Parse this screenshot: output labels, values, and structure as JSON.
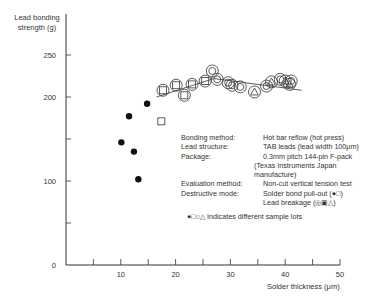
{
  "chart_data": {
    "type": "scatter",
    "title": "",
    "xlabel": "Solder thickness (μm)",
    "ylabel": "Lead bonding strength (g)",
    "xlim": [
      0,
      50
    ],
    "ylim": [
      0,
      300
    ],
    "x_ticks": [
      10,
      20,
      30,
      40,
      50
    ],
    "y_ticks": [
      0,
      100,
      200,
      250
    ],
    "grid": false,
    "series": [
      {
        "name": "Solder bond pull-out (filled circle)",
        "marker": "filled-circle",
        "points": [
          [
            14.8,
            192
          ],
          [
            11.5,
            177
          ],
          [
            10.1,
            146
          ],
          [
            12.4,
            135
          ],
          [
            13.2,
            102
          ]
        ]
      },
      {
        "name": "Solder bond pull-out (square)",
        "marker": "square",
        "points": [
          [
            17.4,
            171
          ]
        ]
      },
      {
        "name": "Lead breakage (circled square)",
        "marker": "circled-square",
        "points": [
          [
            17.7,
            208
          ],
          [
            20.1,
            214
          ],
          [
            21.6,
            202
          ],
          [
            23.0,
            215
          ],
          [
            25.4,
            219
          ]
        ]
      },
      {
        "name": "Lead breakage (circled circle)",
        "marker": "circled-circle",
        "points": [
          [
            26.7,
            231
          ],
          [
            27.6,
            221
          ],
          [
            29.6,
            217
          ],
          [
            30.3,
            214
          ],
          [
            31.8,
            212
          ],
          [
            36.6,
            213
          ],
          [
            39.1,
            221
          ],
          [
            41.1,
            219
          ]
        ]
      },
      {
        "name": "Lead breakage (circled triangle)",
        "marker": "circled-triangle",
        "points": [
          [
            34.4,
            206
          ],
          [
            37.5,
            218
          ],
          [
            40.0,
            219
          ],
          [
            40.8,
            215
          ]
        ]
      }
    ],
    "trend_line": [
      [
        16.5,
        200
      ],
      [
        27,
        222
      ],
      [
        43,
        208
      ]
    ],
    "annotations": {
      "bonding_method": "Hot bar reflow (hot press)",
      "lead_structure": "TAB leads (lead width 100μm)",
      "package": "0.3mm pitch 144-pin F-pack",
      "package_note": "(Texas Instruments Japan  manufacture)",
      "evaluation_method": "Non-cut vertical tension test",
      "destructive_mode_1": "Solder bond pull-out (●□)",
      "destructive_mode_2": "Lead breakage (◎▣△)",
      "legend_note": "●□○△ Indicates different sample lots"
    }
  },
  "axes": {
    "ylabel_line1": "Lead bonding",
    "ylabel_line2": "strength (g)",
    "xlabel": "Solder thickness (μm)",
    "y_tick_labels": [
      "250",
      "200",
      "100",
      "0"
    ],
    "x_tick_labels": [
      "10",
      "20",
      "30",
      "40",
      "50"
    ]
  },
  "notes": [
    {
      "key": "Bonding method:",
      "value": "Hot bar reflow (hot press)"
    },
    {
      "key": "Lead structure:",
      "value": "TAB leads (lead width 100μm)"
    },
    {
      "key": "Package:",
      "value": "0.3mm pitch 144-pin F-pack"
    },
    {
      "key": "",
      "value": "(Texas Instruments Japan  manufacture)"
    },
    {
      "key": "Evaluation method:",
      "value": "Non-cut vertical tension test"
    },
    {
      "key": "Destructive mode:",
      "value": "Solder bond pull-out (●□)"
    },
    {
      "key": "",
      "value": "Lead breakage (◎▣△)"
    }
  ],
  "legend": {
    "symbols": "●□○△",
    "text": "Indicates different sample lots"
  }
}
